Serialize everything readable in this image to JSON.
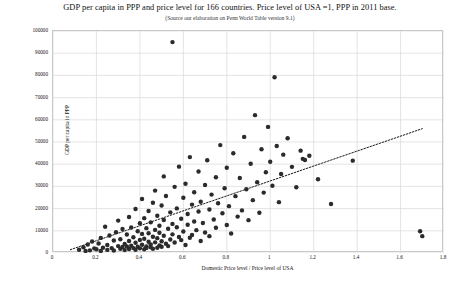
{
  "chart_data": {
    "type": "scatter",
    "title": "GDP per capita in PPP and price level for 166 countries. Price level of USA =1, PPP in 2011 base.",
    "subtitle": "(Source our elaboration on Penn World Table version 9.1)",
    "xlabel": "Domestic Price level / Price level of USA",
    "ylabel": "GDP per capita in PPP",
    "xlim": [
      0,
      1.8
    ],
    "ylim": [
      0,
      100000
    ],
    "xticks": [
      0,
      0.2,
      0.4,
      0.6,
      0.8,
      1,
      1.2,
      1.4,
      1.6,
      1.8
    ],
    "xtick_labels": [
      "0",
      "0.2",
      "0.4",
      "0.6",
      "0.8",
      "1",
      "1.2",
      "1.4",
      "1.6",
      "1.8"
    ],
    "yticks": [
      0,
      10000,
      20000,
      30000,
      40000,
      50000,
      60000,
      70000,
      80000,
      90000,
      100000
    ],
    "ytick_labels": [
      "0",
      "10000",
      "20000",
      "30000",
      "40000",
      "50000",
      "60000",
      "70000",
      "80000",
      "90000",
      "100000"
    ],
    "grid": true,
    "legend": "none",
    "n_points": 166,
    "marker_color": "#2b2b2b",
    "marker_size": 3.2,
    "trendline": {
      "style": "dotted",
      "color": "#1a1a1a",
      "x0": 0.08,
      "y0": 1500,
      "x1": 1.7,
      "y1": 56000
    },
    "points": [
      [
        0.12,
        1500
      ],
      [
        0.14,
        2600
      ],
      [
        0.15,
        900
      ],
      [
        0.16,
        3800
      ],
      [
        0.17,
        1200
      ],
      [
        0.18,
        5200
      ],
      [
        0.19,
        2100
      ],
      [
        0.2,
        1700
      ],
      [
        0.21,
        4300
      ],
      [
        0.22,
        900
      ],
      [
        0.22,
        6800
      ],
      [
        0.23,
        2400
      ],
      [
        0.24,
        11800
      ],
      [
        0.25,
        1400
      ],
      [
        0.25,
        3600
      ],
      [
        0.26,
        7900
      ],
      [
        0.27,
        2200
      ],
      [
        0.28,
        5600
      ],
      [
        0.28,
        1100
      ],
      [
        0.29,
        9400
      ],
      [
        0.3,
        3100
      ],
      [
        0.3,
        14600
      ],
      [
        0.31,
        1900
      ],
      [
        0.31,
        6200
      ],
      [
        0.32,
        2700
      ],
      [
        0.32,
        10800
      ],
      [
        0.33,
        4100
      ],
      [
        0.33,
        1300
      ],
      [
        0.34,
        8300
      ],
      [
        0.34,
        2900
      ],
      [
        0.35,
        16200
      ],
      [
        0.35,
        5400
      ],
      [
        0.35,
        1800
      ],
      [
        0.36,
        3300
      ],
      [
        0.36,
        11500
      ],
      [
        0.37,
        2200
      ],
      [
        0.37,
        7100
      ],
      [
        0.38,
        19800
      ],
      [
        0.38,
        4600
      ],
      [
        0.38,
        1500
      ],
      [
        0.39,
        9800
      ],
      [
        0.39,
        2800
      ],
      [
        0.4,
        13400
      ],
      [
        0.4,
        5900
      ],
      [
        0.4,
        2100
      ],
      [
        0.41,
        24300
      ],
      [
        0.41,
        3700
      ],
      [
        0.41,
        8600
      ],
      [
        0.42,
        1700
      ],
      [
        0.42,
        15700
      ],
      [
        0.42,
        6400
      ],
      [
        0.43,
        3000
      ],
      [
        0.43,
        11200
      ],
      [
        0.43,
        2300
      ],
      [
        0.44,
        18900
      ],
      [
        0.44,
        5100
      ],
      [
        0.44,
        8900
      ],
      [
        0.45,
        2600
      ],
      [
        0.45,
        13800
      ],
      [
        0.45,
        3900
      ],
      [
        0.46,
        22600
      ],
      [
        0.46,
        7300
      ],
      [
        0.46,
        1900
      ],
      [
        0.47,
        10400
      ],
      [
        0.47,
        4800
      ],
      [
        0.47,
        28100
      ],
      [
        0.48,
        2400
      ],
      [
        0.48,
        16800
      ],
      [
        0.48,
        6700
      ],
      [
        0.49,
        3400
      ],
      [
        0.49,
        12300
      ],
      [
        0.49,
        9100
      ],
      [
        0.5,
        21400
      ],
      [
        0.5,
        5300
      ],
      [
        0.5,
        2800
      ],
      [
        0.51,
        34500
      ],
      [
        0.51,
        14900
      ],
      [
        0.51,
        7800
      ],
      [
        0.52,
        4200
      ],
      [
        0.52,
        25700
      ],
      [
        0.53,
        10900
      ],
      [
        0.53,
        3100
      ],
      [
        0.54,
        18300
      ],
      [
        0.54,
        6100
      ],
      [
        0.55,
        95000
      ],
      [
        0.55,
        13100
      ],
      [
        0.55,
        8400
      ],
      [
        0.56,
        29800
      ],
      [
        0.56,
        4700
      ],
      [
        0.57,
        20100
      ],
      [
        0.57,
        11600
      ],
      [
        0.58,
        7200
      ],
      [
        0.58,
        38900
      ],
      [
        0.59,
        15400
      ],
      [
        0.59,
        5800
      ],
      [
        0.6,
        24900
      ],
      [
        0.6,
        9700
      ],
      [
        0.61,
        3600
      ],
      [
        0.61,
        31200
      ],
      [
        0.62,
        17600
      ],
      [
        0.62,
        12700
      ],
      [
        0.63,
        6900
      ],
      [
        0.63,
        43200
      ],
      [
        0.64,
        21800
      ],
      [
        0.64,
        8100
      ],
      [
        0.65,
        14200
      ],
      [
        0.65,
        27400
      ],
      [
        0.66,
        10300
      ],
      [
        0.67,
        36700
      ],
      [
        0.67,
        18700
      ],
      [
        0.68,
        5400
      ],
      [
        0.68,
        23100
      ],
      [
        0.69,
        13500
      ],
      [
        0.7,
        30600
      ],
      [
        0.7,
        9200
      ],
      [
        0.71,
        41800
      ],
      [
        0.72,
        19600
      ],
      [
        0.72,
        7600
      ],
      [
        0.73,
        26300
      ],
      [
        0.74,
        15100
      ],
      [
        0.75,
        34100
      ],
      [
        0.75,
        11400
      ],
      [
        0.76,
        22400
      ],
      [
        0.77,
        48600
      ],
      [
        0.78,
        17900
      ],
      [
        0.79,
        29200
      ],
      [
        0.8,
        12600
      ],
      [
        0.8,
        38400
      ],
      [
        0.81,
        21100
      ],
      [
        0.82,
        8800
      ],
      [
        0.83,
        44900
      ],
      [
        0.84,
        25600
      ],
      [
        0.85,
        16400
      ],
      [
        0.86,
        33800
      ],
      [
        0.87,
        19200
      ],
      [
        0.88,
        52300
      ],
      [
        0.89,
        28700
      ],
      [
        0.9,
        14800
      ],
      [
        0.91,
        40200
      ],
      [
        0.92,
        23800
      ],
      [
        0.93,
        62100
      ],
      [
        0.94,
        31900
      ],
      [
        0.95,
        18100
      ],
      [
        0.96,
        46700
      ],
      [
        0.97,
        27200
      ],
      [
        0.98,
        36400
      ],
      [
        0.99,
        56800
      ],
      [
        1.0,
        41100
      ],
      [
        1.01,
        30300
      ],
      [
        1.02,
        79200
      ],
      [
        1.03,
        48200
      ],
      [
        1.04,
        22900
      ],
      [
        1.05,
        35600
      ],
      [
        1.06,
        44300
      ],
      [
        1.08,
        51700
      ],
      [
        1.1,
        38800
      ],
      [
        1.12,
        29600
      ],
      [
        1.14,
        46100
      ],
      [
        1.15,
        42400
      ],
      [
        1.16,
        41900
      ],
      [
        1.18,
        43800
      ],
      [
        1.22,
        33200
      ],
      [
        1.28,
        22100
      ],
      [
        1.38,
        41600
      ],
      [
        1.69,
        9800
      ],
      [
        1.7,
        7600
      ]
    ]
  }
}
